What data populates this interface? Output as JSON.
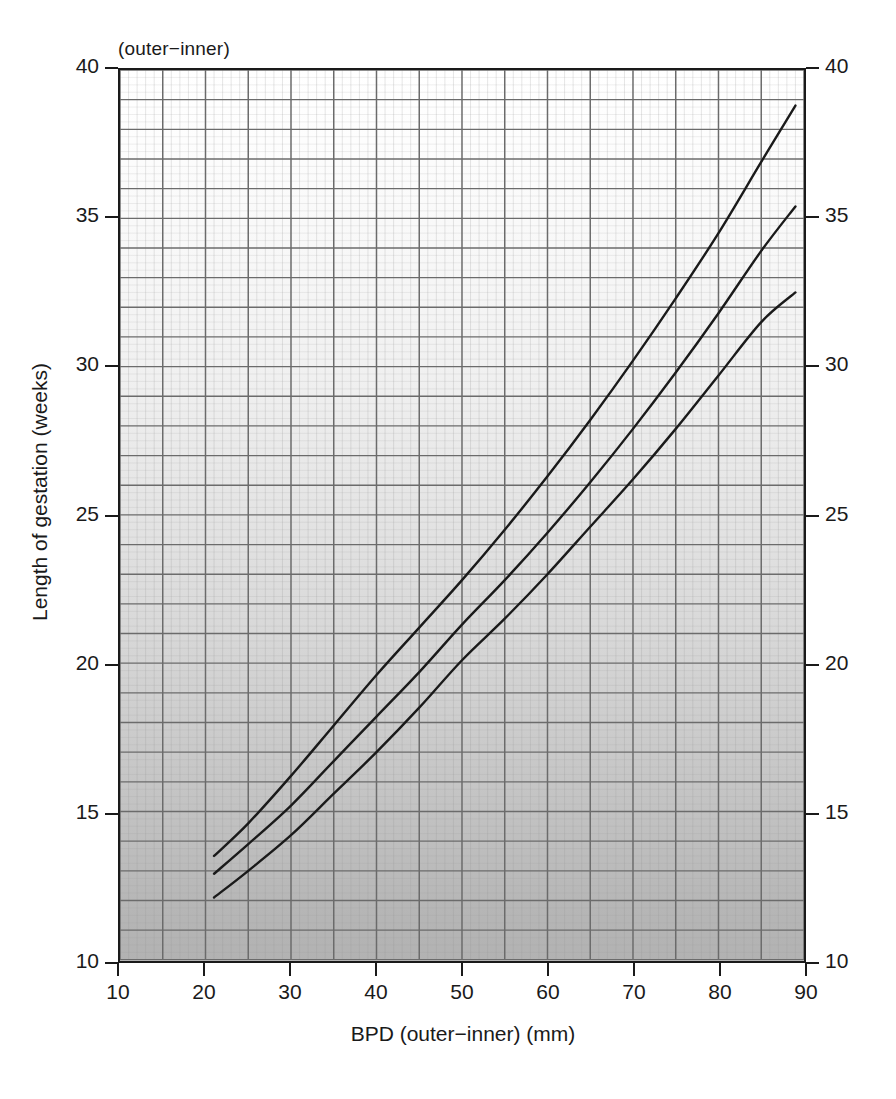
{
  "figure": {
    "header_note": "(outer−inner)",
    "x_title": "BPD (outer−inner) (mm)",
    "y_title": "Length of gestation (weeks)"
  },
  "chart_data": {
    "type": "line",
    "title": "",
    "subtitle": "(outer−inner)",
    "xlabel": "BPD (outer−inner) (mm)",
    "ylabel": "Length of gestation (weeks)",
    "xlim": [
      10,
      90
    ],
    "ylim": [
      10,
      40
    ],
    "x_major_ticks": [
      10,
      20,
      30,
      40,
      50,
      60,
      70,
      80,
      90
    ],
    "y_major_ticks": [
      10,
      15,
      20,
      25,
      30,
      35,
      40
    ],
    "x_tick_labels": [
      "10",
      "20",
      "30",
      "40",
      "50",
      "60",
      "70",
      "80",
      "90"
    ],
    "y_tick_labels": [
      "10",
      "15",
      "20",
      "25",
      "30",
      "35",
      "40"
    ],
    "y_tick_labels_right": [
      "10",
      "15",
      "20",
      "25",
      "30",
      "35",
      "40"
    ],
    "x_gridline_step": 5,
    "y_gridline_step": 1,
    "grid": true,
    "minor_grid": true,
    "legend": "none",
    "line_color": "#1a1a1a",
    "background": "grey-gradient-white-top-to-grey-bottom",
    "series": [
      {
        "name": "upper-centile",
        "x": [
          21,
          25,
          30,
          35,
          40,
          45,
          50,
          55,
          60,
          65,
          70,
          75,
          80,
          85,
          89
        ],
        "y": [
          13.5,
          14.6,
          16.2,
          17.9,
          19.6,
          21.2,
          22.8,
          24.5,
          26.3,
          28.2,
          30.2,
          32.3,
          34.5,
          36.9,
          38.8
        ]
      },
      {
        "name": "median-centile",
        "x": [
          21,
          25,
          30,
          35,
          40,
          45,
          50,
          55,
          60,
          65,
          70,
          75,
          80,
          85,
          89
        ],
        "y": [
          12.9,
          13.9,
          15.2,
          16.7,
          18.2,
          19.7,
          21.3,
          22.8,
          24.4,
          26.1,
          27.9,
          29.8,
          31.8,
          33.9,
          35.4
        ]
      },
      {
        "name": "lower-centile",
        "x": [
          21,
          25,
          30,
          35,
          40,
          45,
          50,
          55,
          60,
          65,
          70,
          75,
          80,
          85,
          89
        ],
        "y": [
          12.1,
          13.0,
          14.2,
          15.6,
          17.0,
          18.5,
          20.1,
          21.5,
          23.0,
          24.6,
          26.2,
          27.9,
          29.7,
          31.5,
          32.5
        ]
      }
    ]
  }
}
